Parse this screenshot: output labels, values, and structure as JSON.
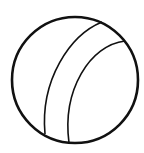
{
  "figure": {
    "icon": "ball-icon",
    "colors": {
      "background": "#ffffff",
      "stroke": "#111111"
    }
  }
}
